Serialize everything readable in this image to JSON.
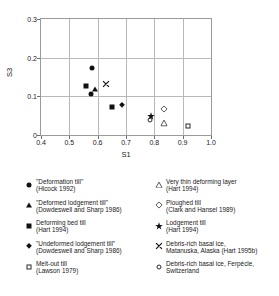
{
  "chart_data": {
    "type": "scatter",
    "title": "",
    "xlabel": "S1",
    "ylabel": "S3",
    "xlim": [
      0.4,
      1.0
    ],
    "ylim": [
      0.0,
      0.3
    ],
    "xticks": [
      "0.4",
      "0.5",
      "0.6",
      "0.7",
      "0.8",
      "0.9",
      "1.0"
    ],
    "yticks": [
      "0",
      "0.1",
      "0.2",
      "0.3"
    ],
    "xtick_values": [
      0.4,
      0.5,
      0.6,
      0.7,
      0.8,
      0.9,
      1.0
    ],
    "ytick_values": [
      0,
      0.1,
      0.2,
      0.3
    ],
    "grid": true,
    "legend_position": "below",
    "series": [
      {
        "name": "\"Deformation till\" (Hicock 1992)",
        "marker": "circle-filled",
        "points": [
          [
            0.58,
            0.172
          ],
          [
            0.576,
            0.107
          ]
        ]
      },
      {
        "name": "\"Deformed lodgement till\" (Dowdeswell and Sharp 1986)",
        "marker": "triangle-filled",
        "points": [
          [
            0.59,
            0.12
          ]
        ]
      },
      {
        "name": "Deforming bed till (Hart 1994)",
        "marker": "square-filled",
        "points": [
          [
            0.559,
            0.128
          ],
          [
            0.65,
            0.072
          ]
        ]
      },
      {
        "name": "\"Undeformed lodgement till\" (Dowdeswell and Sharp 1986)",
        "marker": "diamond-filled",
        "points": [
          [
            0.685,
            0.078
          ]
        ]
      },
      {
        "name": "Melt-out till (Lawson 1979)",
        "marker": "square-open",
        "points": [
          [
            0.918,
            0.022
          ]
        ]
      },
      {
        "name": "Very thin deforming layer (Hart 1994)",
        "marker": "triangle-open",
        "points": [
          [
            0.835,
            0.03
          ]
        ]
      },
      {
        "name": "Ploughed till (Clark and Hansel 1989)",
        "marker": "diamond-open",
        "points": [
          [
            0.833,
            0.068
          ]
        ]
      },
      {
        "name": "Lodgement till (Hart 1994)",
        "marker": "star",
        "points": [
          [
            0.787,
            0.05
          ]
        ]
      },
      {
        "name": "Debris-rich basal ice, Matanuska, Alaska (Hart 1995b)",
        "marker": "x",
        "points": [
          [
            0.628,
            0.133
          ]
        ]
      },
      {
        "name": "Debris-rich basal ice, Ferpècle, Switzerland",
        "marker": "circle-open",
        "points": [
          [
            0.785,
            0.039
          ]
        ]
      }
    ]
  },
  "axes": {
    "x_title": "S1",
    "y_title": "S3",
    "x_labels": [
      "0.4",
      "0.5",
      "0.6",
      "0.7",
      "0.8",
      "0.9",
      "1.0"
    ],
    "y_labels": [
      "0.3",
      "0.2",
      "0.1",
      "0"
    ]
  },
  "legend": {
    "left_column": [
      {
        "marker": "circle-filled",
        "line1": "\"Deformation till\"",
        "line2": "(Hicock 1992)"
      },
      {
        "marker": "triangle-filled",
        "line1": "\"Deformed lodgement till\"",
        "line2": "(Dowdeswell and Sharp 1986)"
      },
      {
        "marker": "square-filled",
        "line1": "Deforming bed till",
        "line2": "(Hart 1994)"
      },
      {
        "marker": "diamond-filled",
        "line1": "\"Undeformed lodgement till\"",
        "line2": "(Dowdeswell and Sharp 1986)"
      },
      {
        "marker": "square-open",
        "line1": "Melt-out till",
        "line2": "(Lawson 1979)"
      }
    ],
    "right_column": [
      {
        "marker": "triangle-open",
        "line1": "Very thin deforming layer",
        "line2": "(Hart 1994)"
      },
      {
        "marker": "diamond-open",
        "line1": "Ploughed till",
        "line2": "(Clark and Hansel 1989)"
      },
      {
        "marker": "star",
        "line1": "Lodgement till",
        "line2": "(Hart 1994)"
      },
      {
        "marker": "x",
        "line1": "Debris-rich basal ice,",
        "line2": "Matanuska, Alaska (Hart 1995b)"
      },
      {
        "marker": "circle-open",
        "line1": "Debris-rich basal ice, Ferpècle,",
        "line2": "Switzerland"
      }
    ]
  },
  "colors": {
    "marker_fill": "#111111",
    "grid": "#b8b8b8",
    "frame": "#9a9a9a",
    "text": "#1a1a1a"
  }
}
